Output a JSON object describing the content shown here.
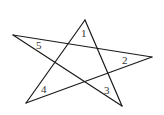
{
  "diagram": {
    "type": "pentagram",
    "vertices": [
      {
        "id": "top",
        "x": 85,
        "y": 20
      },
      {
        "id": "right",
        "x": 152,
        "y": 57
      },
      {
        "id": "bottom-left",
        "x": 26,
        "y": 103
      },
      {
        "id": "left",
        "x": 13,
        "y": 35
      },
      {
        "id": "bottom-right",
        "x": 122,
        "y": 106
      }
    ],
    "labels": [
      {
        "text": "1",
        "x": 81,
        "y": 37
      },
      {
        "text": "2",
        "x": 122,
        "y": 64
      },
      {
        "text": "3",
        "x": 104,
        "y": 94
      },
      {
        "text": "4",
        "x": 41,
        "y": 93
      },
      {
        "text": "5",
        "x": 36,
        "y": 49
      }
    ],
    "stroke_color": "#1a1a1a"
  }
}
